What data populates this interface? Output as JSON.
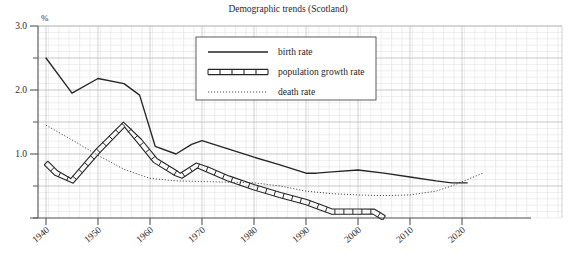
{
  "chart_data": {
    "type": "line",
    "title": "Demographic trends (Scotland)",
    "xlabel": "",
    "ylabel": "%",
    "xlim": [
      1940,
      2024
    ],
    "ylim": [
      0,
      3.0
    ],
    "grid": true,
    "legend_position": "top-center",
    "y_ticks_major": [
      "3.0",
      "2.0",
      "1.0"
    ],
    "y_tick_values_major": [
      3.0,
      2.0,
      1.0
    ],
    "y_tick_values_minor": [
      2.5,
      1.5,
      0.5,
      0.0
    ],
    "x_ticks": [
      "1940",
      "1950",
      "1960",
      "1970",
      "1980",
      "1990",
      "2000",
      "2010",
      "2020"
    ],
    "x_tick_values": [
      1940,
      1950,
      1960,
      1970,
      1980,
      1990,
      2000,
      2010,
      2020
    ],
    "series": [
      {
        "name": "birth rate",
        "style": "solid",
        "x": [
          1940,
          1945,
          1950,
          1955,
          1958,
          1961,
          1965,
          1968,
          1970,
          1975,
          1980,
          1985,
          1990,
          1992,
          1995,
          2000,
          2005,
          2010,
          2015,
          2018,
          2021
        ],
        "values": [
          2.5,
          1.95,
          2.18,
          2.1,
          1.92,
          1.12,
          1.0,
          1.15,
          1.21,
          1.08,
          0.95,
          0.83,
          0.7,
          0.7,
          0.72,
          0.75,
          0.7,
          0.64,
          0.58,
          0.55,
          0.55
        ]
      },
      {
        "name": "population growth rate",
        "style": "ladder",
        "x": [
          1940,
          1942,
          1945,
          1950,
          1955,
          1958,
          1961,
          1965,
          1966,
          1969,
          1971,
          1975,
          1980,
          1985,
          1990,
          1993,
          1995,
          2000,
          2003,
          2005
        ],
        "values": [
          0.86,
          0.7,
          0.58,
          1.05,
          1.46,
          1.2,
          0.9,
          0.7,
          0.66,
          0.82,
          0.76,
          0.62,
          0.48,
          0.36,
          0.25,
          0.16,
          0.1,
          0.1,
          0.1,
          0.0
        ]
      },
      {
        "name": "death rate",
        "style": "dotted",
        "x": [
          1940,
          1945,
          1950,
          1955,
          1960,
          1965,
          1970,
          1975,
          1980,
          1985,
          1990,
          1995,
          2000,
          2005,
          2010,
          2015,
          2018,
          2021,
          2024
        ],
        "values": [
          1.45,
          1.22,
          0.98,
          0.76,
          0.62,
          0.58,
          0.57,
          0.56,
          0.55,
          0.5,
          0.42,
          0.38,
          0.36,
          0.35,
          0.36,
          0.42,
          0.5,
          0.6,
          0.7
        ]
      }
    ]
  },
  "legend": {
    "items": [
      {
        "label": "birth rate",
        "style": "solid"
      },
      {
        "label": "population growth rate",
        "style": "ladder"
      },
      {
        "label": "death rate",
        "style": "dotted"
      }
    ]
  },
  "colors": {
    "line": "#262626",
    "grid_minor": "#dcdcdc",
    "grid_major": "#bdbdbd",
    "axis": "#555555",
    "text": "#2a2a2a",
    "background": "#ffffff"
  }
}
